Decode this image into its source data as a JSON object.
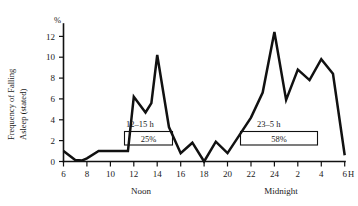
{
  "chart_data": {
    "type": "line",
    "title": "",
    "xlabel": "H",
    "ylabel": "Frequency of Falling Asleep (stated)",
    "yunit": "%",
    "xlim": [
      6,
      30
    ],
    "ylim": [
      0,
      13
    ],
    "grid": false,
    "legend": "none",
    "y_ticks": [
      0,
      2,
      4,
      6,
      8,
      10,
      12
    ],
    "y_tick_labels": [
      "0",
      "2",
      "4",
      "6",
      "8",
      "10",
      "12"
    ],
    "x_ticks": [
      6,
      8,
      10,
      12,
      14,
      16,
      18,
      20,
      22,
      24,
      26,
      28,
      30
    ],
    "x_tick_labels": [
      "6",
      "8",
      "10",
      "12",
      "14",
      "16",
      "18",
      "20",
      "22",
      "24",
      "2",
      "4",
      "6"
    ],
    "period_markers": [
      {
        "label": "Noon",
        "x": 13
      },
      {
        "label": "Midnight",
        "x": 25
      }
    ],
    "x": [
      6,
      7,
      7.6,
      8,
      9,
      10,
      11,
      11.5,
      12,
      13,
      13.5,
      14,
      15,
      16,
      17,
      18,
      19,
      20,
      21,
      22,
      23,
      24,
      25,
      26,
      27,
      28,
      29,
      30
    ],
    "values": [
      1.0,
      0.15,
      0.1,
      0.3,
      1.0,
      1.0,
      1.0,
      1.0,
      6.2,
      4.7,
      5.6,
      10.2,
      3.3,
      0.8,
      1.8,
      0.0,
      1.9,
      0.8,
      2.5,
      4.2,
      6.6,
      12.4,
      5.9,
      8.8,
      7.8,
      9.8,
      8.4,
      0.6
    ],
    "annotations": [
      {
        "name": "afternoon-nap-band",
        "range_label": "12–15 h",
        "value_label": "25%",
        "x_start": 12,
        "x_end": 15
      },
      {
        "name": "night-sleep-band",
        "range_label": "23–5 h",
        "value_label": "58%",
        "x_start": 23,
        "x_end": 29
      }
    ]
  }
}
